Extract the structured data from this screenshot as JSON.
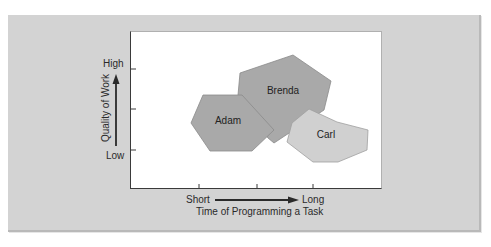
{
  "figure": {
    "y_axis": {
      "title": "Quality of Work",
      "high_label": "High",
      "low_label": "Low"
    },
    "x_axis": {
      "title": "Time of Programming a Task",
      "short_label": "Short",
      "long_label": "Long"
    },
    "regions": [
      {
        "name": "Adam",
        "fill": "#a9a9a9"
      },
      {
        "name": "Brenda",
        "fill": "#a9a9a9"
      },
      {
        "name": "Carl",
        "fill": "#d0d0d0"
      }
    ],
    "colors": {
      "panel": "#d3d3d3",
      "plot_background": "#ffffff",
      "stroke": "#8a8a8a",
      "axis": "#3a3a3a"
    }
  }
}
